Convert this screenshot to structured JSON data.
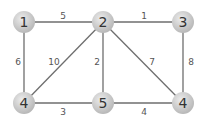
{
  "graph": {
    "nodes": [
      {
        "id": "n1",
        "label": "1",
        "x": 24,
        "y": 22
      },
      {
        "id": "n2",
        "label": "2",
        "x": 103,
        "y": 22
      },
      {
        "id": "n3",
        "label": "3",
        "x": 183,
        "y": 22
      },
      {
        "id": "n4a",
        "label": "4",
        "x": 24,
        "y": 103
      },
      {
        "id": "n5",
        "label": "5",
        "x": 103,
        "y": 103
      },
      {
        "id": "n4b",
        "label": "4",
        "x": 183,
        "y": 103
      }
    ],
    "edges": [
      {
        "from": "n1",
        "to": "n2",
        "weight": "5"
      },
      {
        "from": "n2",
        "to": "n3",
        "weight": "1"
      },
      {
        "from": "n1",
        "to": "n4a",
        "weight": "6"
      },
      {
        "from": "n2",
        "to": "n4a",
        "weight": "10"
      },
      {
        "from": "n2",
        "to": "n5",
        "weight": "2"
      },
      {
        "from": "n2",
        "to": "n4b",
        "weight": "7"
      },
      {
        "from": "n3",
        "to": "n4b",
        "weight": "8"
      },
      {
        "from": "n4a",
        "to": "n5",
        "weight": "3"
      },
      {
        "from": "n5",
        "to": "n4b",
        "weight": "4"
      }
    ]
  }
}
